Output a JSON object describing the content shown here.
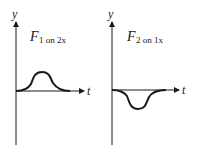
{
  "panels": [
    {
      "y_label": "y",
      "x_label": "t",
      "force_label_main": "F",
      "force_label_sub": "1 on 2x",
      "curve_direction": "positive-bump"
    },
    {
      "y_label": "y",
      "x_label": "t",
      "force_label_main": "F",
      "force_label_sub": "2 on 1x",
      "curve_direction": "negative-dip"
    }
  ],
  "colors": {
    "line": "#1a1a1a",
    "background": "#ffffff"
  }
}
